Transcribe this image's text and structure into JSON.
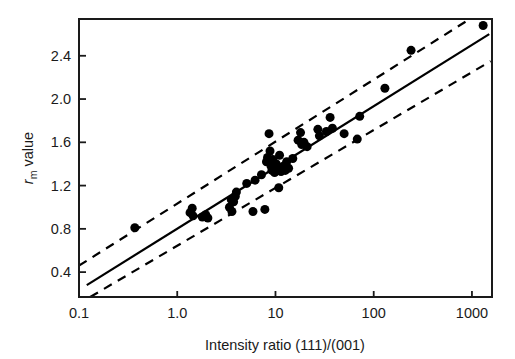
{
  "chart_data": {
    "type": "scatter",
    "title": "",
    "xlabel": "Intensity ratio (111)/(001)",
    "ylabel": "r_m value",
    "ylabel_parts": {
      "symbol": "r",
      "subscript": "m",
      "word": " value"
    },
    "xscale": "log",
    "yscale": "linear",
    "xlim": [
      0.1,
      1600
    ],
    "ylim": [
      0.17,
      2.74
    ],
    "xticks": [
      0.1,
      1.0,
      10,
      100,
      1000
    ],
    "xticklabels": [
      "0.1",
      "1.0",
      "10",
      "100",
      "1000"
    ],
    "yticks": [
      0.4,
      0.8,
      1.2,
      1.6,
      2.0,
      2.4
    ],
    "yticklabels": [
      "0.4",
      "0.8",
      "1.2",
      "1.6",
      "2.0",
      "2.4"
    ],
    "grid": false,
    "legend": null,
    "marker": {
      "shape": "circle",
      "color": "#000000",
      "size": 9
    },
    "points": [
      {
        "x": 0.37,
        "y": 0.81
      },
      {
        "x": 1.35,
        "y": 0.95
      },
      {
        "x": 1.42,
        "y": 0.99
      },
      {
        "x": 1.45,
        "y": 0.92
      },
      {
        "x": 1.8,
        "y": 0.91
      },
      {
        "x": 1.95,
        "y": 0.93
      },
      {
        "x": 2.05,
        "y": 0.9
      },
      {
        "x": 3.4,
        "y": 1.0
      },
      {
        "x": 3.55,
        "y": 1.07
      },
      {
        "x": 3.6,
        "y": 0.96
      },
      {
        "x": 3.75,
        "y": 1.05
      },
      {
        "x": 3.9,
        "y": 1.1
      },
      {
        "x": 4.0,
        "y": 1.14
      },
      {
        "x": 5.1,
        "y": 1.22
      },
      {
        "x": 5.9,
        "y": 0.96
      },
      {
        "x": 6.2,
        "y": 1.25
      },
      {
        "x": 7.2,
        "y": 1.3
      },
      {
        "x": 7.8,
        "y": 0.98
      },
      {
        "x": 8.1,
        "y": 1.42
      },
      {
        "x": 8.3,
        "y": 1.46
      },
      {
        "x": 8.6,
        "y": 1.68
      },
      {
        "x": 8.8,
        "y": 1.52
      },
      {
        "x": 9.0,
        "y": 1.38
      },
      {
        "x": 9.2,
        "y": 1.34
      },
      {
        "x": 9.4,
        "y": 1.44
      },
      {
        "x": 9.6,
        "y": 1.36
      },
      {
        "x": 9.8,
        "y": 1.32
      },
      {
        "x": 10.2,
        "y": 1.4
      },
      {
        "x": 10.5,
        "y": 1.35
      },
      {
        "x": 10.8,
        "y": 1.18
      },
      {
        "x": 11.0,
        "y": 1.48
      },
      {
        "x": 11.4,
        "y": 1.33
      },
      {
        "x": 11.8,
        "y": 1.36
      },
      {
        "x": 12.2,
        "y": 1.38
      },
      {
        "x": 12.6,
        "y": 1.34
      },
      {
        "x": 13.0,
        "y": 1.42
      },
      {
        "x": 13.6,
        "y": 1.36
      },
      {
        "x": 15.0,
        "y": 1.45
      },
      {
        "x": 17.0,
        "y": 1.62
      },
      {
        "x": 18.0,
        "y": 1.69
      },
      {
        "x": 18.5,
        "y": 1.58
      },
      {
        "x": 19.5,
        "y": 1.6
      },
      {
        "x": 21.0,
        "y": 1.56
      },
      {
        "x": 27.0,
        "y": 1.72
      },
      {
        "x": 28.0,
        "y": 1.66
      },
      {
        "x": 33.0,
        "y": 1.7
      },
      {
        "x": 36.0,
        "y": 1.83
      },
      {
        "x": 38.0,
        "y": 1.73
      },
      {
        "x": 50.0,
        "y": 1.68
      },
      {
        "x": 68.0,
        "y": 1.63
      },
      {
        "x": 72.0,
        "y": 1.84
      },
      {
        "x": 130.0,
        "y": 2.1
      },
      {
        "x": 240.0,
        "y": 2.45
      },
      {
        "x": 1300.0,
        "y": 2.68
      }
    ],
    "lines": [
      {
        "name": "regression-line",
        "style": "solid",
        "color": "#000000",
        "width": 2.2,
        "endpoints": [
          {
            "x": 0.12,
            "y": 0.28
          },
          {
            "x": 1500,
            "y": 2.6
          }
        ]
      },
      {
        "name": "upper-confidence-band",
        "style": "dashed",
        "color": "#000000",
        "width": 2.2,
        "endpoints": [
          {
            "x": 0.1,
            "y": 0.46
          },
          {
            "x": 950,
            "y": 2.74
          }
        ]
      },
      {
        "name": "lower-confidence-band",
        "style": "dashed",
        "color": "#000000",
        "width": 2.2,
        "endpoints": [
          {
            "x": 0.13,
            "y": 0.17
          },
          {
            "x": 1550,
            "y": 2.35
          }
        ]
      }
    ]
  },
  "figure": {
    "background": "#ffffff",
    "frame_color": "#1a1a1a",
    "frame_width": 2.0
  }
}
